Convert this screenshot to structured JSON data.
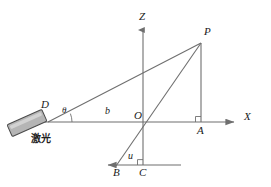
{
  "figure": {
    "type": "geometry-optics-diagram",
    "canvas": {
      "width": 271,
      "height": 187
    },
    "colors": {
      "line": "#6f6f6f",
      "axis": "#6f6f6f",
      "text": "#1a1a1a",
      "laser_fill": "#b5b5b5",
      "laser_stroke": "#4a4a4a",
      "background": "#ffffff"
    }
  },
  "axes": {
    "z": {
      "label": "Z",
      "direction": "up",
      "x": 143,
      "tip_y": 28,
      "base_y": 165
    },
    "x": {
      "label": "X",
      "direction": "right",
      "y": 122,
      "start_x": 45,
      "tip_x": 237
    }
  },
  "points": {
    "O": {
      "label": "O",
      "x": 143,
      "y": 122,
      "desc": "origin"
    },
    "P": {
      "label": "P",
      "x": 201,
      "y": 43,
      "desc": "target point"
    },
    "A": {
      "label": "A",
      "x": 201,
      "y": 122,
      "desc": "foot of perpendicular from P to X axis"
    },
    "B": {
      "label": "B",
      "x": 117,
      "y": 165,
      "desc": "point on lower horizontal line"
    },
    "C": {
      "label": "C",
      "x": 143,
      "y": 165,
      "desc": "intersection of Z axis line and lower line"
    },
    "D": {
      "label": "D",
      "x": 48,
      "y": 122,
      "desc": "laser emitter origin on X axis"
    }
  },
  "segments": [
    {
      "name": "laser-beam-DP",
      "from": "D",
      "to": "P",
      "label": null
    },
    {
      "name": "line-BP",
      "from": "B",
      "to": "P",
      "label": null
    },
    {
      "name": "perpendicular-PA",
      "from": "P",
      "to": "A",
      "label": null
    },
    {
      "name": "baseline-OD",
      "from": "D",
      "to": "O",
      "label": "b"
    },
    {
      "name": "segment-BC",
      "from": "B",
      "to": "C",
      "label": "u"
    }
  ],
  "labels": {
    "b": {
      "text": "b",
      "x": 108,
      "y": 108
    },
    "u": {
      "text": "u",
      "x": 130,
      "y": 153
    },
    "theta": {
      "text": "θ",
      "x": 62,
      "y": 108
    }
  },
  "laser": {
    "caption": "激光",
    "caption_x": 31,
    "caption_y": 136,
    "body": {
      "cx": 27,
      "cy": 123,
      "length": 38,
      "width": 13,
      "rotation_deg": -24
    }
  },
  "angle_marks": [
    {
      "name": "angle-theta-at-D",
      "type": "arc",
      "vertex": "D",
      "label": "θ"
    },
    {
      "name": "right-angle-at-A",
      "type": "square",
      "vertex": "A"
    },
    {
      "name": "right-angle-at-C",
      "type": "square",
      "vertex": "C"
    }
  ],
  "lower_line": {
    "name": "lower-horizontal-line",
    "y": 165,
    "arrow_x": 105,
    "end_x": 181,
    "direction": "left"
  }
}
